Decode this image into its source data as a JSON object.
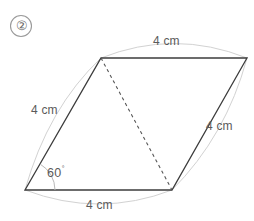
{
  "figure": {
    "item_number": "②",
    "shape_name": "rhombus",
    "angle_label": "60",
    "angle_degree_symbol": "°",
    "edge_labels": {
      "top": "4 cm",
      "left": "4 cm",
      "right": "4 cm",
      "bottom": "4 cm"
    },
    "colors": {
      "outline": "#3c3c3c",
      "diagonal": "#555555",
      "arc": "#cfcfcf",
      "text": "#5a5a5a",
      "background": "#ffffff"
    },
    "vertices": {
      "bottom_left": [
        25,
        190
      ],
      "top_left": [
        101,
        58
      ],
      "top_right": [
        247,
        58
      ],
      "bottom_right": [
        172,
        190
      ]
    },
    "diagonal": {
      "from": "top_left",
      "to": "bottom_right",
      "style": "dashed"
    }
  }
}
